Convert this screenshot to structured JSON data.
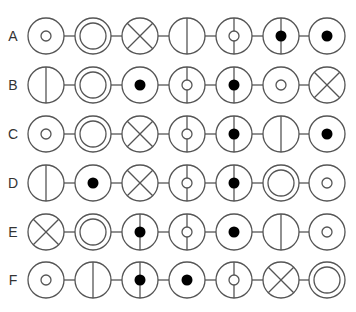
{
  "colors": {
    "stroke": "#555555",
    "fill": "#000000",
    "label": "#333333",
    "background": "#ffffff"
  },
  "layout": {
    "column_x": [
      46,
      93,
      140,
      187,
      234,
      281,
      327
    ],
    "row_y": [
      36,
      85,
      134,
      183,
      232,
      280
    ],
    "label_x": 13,
    "radius": 18,
    "inner_ring_radius": 13,
    "small_circle_radius": 5,
    "dot_radius": 5.5
  },
  "legend": {
    "dot": "small open circle",
    "double": "double ring",
    "x": "X cross",
    "v": "vertical line",
    "vo": "vertical line with small open circle",
    "vf": "vertical line with filled dot",
    "f": "filled dot"
  },
  "rows": [
    {
      "label": "A",
      "cells": [
        "dot",
        "double",
        "x",
        "v",
        "vo",
        "vf",
        "f"
      ]
    },
    {
      "label": "B",
      "cells": [
        "v",
        "double",
        "f",
        "vo",
        "vf",
        "dot",
        "x"
      ]
    },
    {
      "label": "C",
      "cells": [
        "dot",
        "double",
        "x",
        "vo",
        "vf",
        "v",
        "f"
      ]
    },
    {
      "label": "D",
      "cells": [
        "v",
        "f",
        "x",
        "vo",
        "vf",
        "double",
        "dot"
      ]
    },
    {
      "label": "E",
      "cells": [
        "x",
        "double",
        "vf",
        "vo",
        "f",
        "v",
        "dot"
      ]
    },
    {
      "label": "F",
      "cells": [
        "dot",
        "v",
        "vf",
        "f",
        "vo",
        "x",
        "double"
      ]
    }
  ]
}
